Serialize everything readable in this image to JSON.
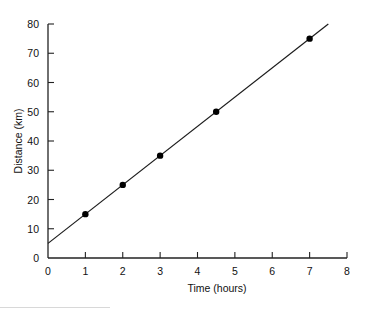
{
  "chart_data": {
    "type": "line",
    "title": "",
    "xlabel": "Time (hours)",
    "ylabel": "Distance (km)",
    "xlim": [
      0,
      8
    ],
    "ylim": [
      0,
      80
    ],
    "x_ticks": [
      0,
      1,
      2,
      3,
      4,
      5,
      6,
      7,
      8
    ],
    "y_ticks": [
      0,
      10,
      20,
      30,
      40,
      50,
      60,
      70,
      80
    ],
    "grid": false,
    "legend": null,
    "series": [
      {
        "name": "Measured points",
        "kind": "scatter",
        "points": [
          {
            "x": 1,
            "y": 15
          },
          {
            "x": 2,
            "y": 25
          },
          {
            "x": 3,
            "y": 35
          },
          {
            "x": 4.5,
            "y": 50
          },
          {
            "x": 7,
            "y": 75
          }
        ]
      },
      {
        "name": "Best-fit line",
        "kind": "line",
        "slope": 10,
        "intercept": 5,
        "x_range": [
          0,
          7.5
        ]
      }
    ]
  },
  "colors": {
    "axis": "#222222",
    "line": "#1a1a1a",
    "marker": "#000000",
    "background": "#ffffff"
  }
}
